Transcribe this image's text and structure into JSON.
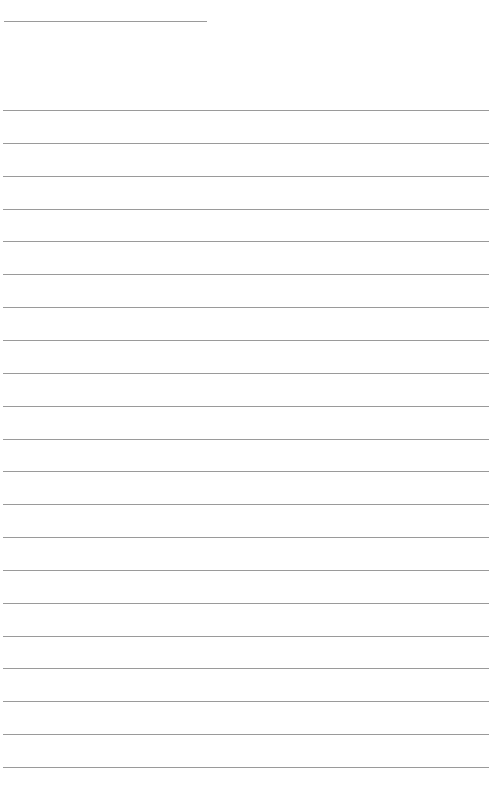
{
  "page": {
    "type": "lined-paper",
    "background": "#ffffff",
    "rule_color": "#9a9a9a",
    "header_line": {
      "top": 21,
      "left": 4,
      "width": 203
    },
    "ruled_lines": {
      "count": 21,
      "first_top": 110,
      "spacing": 32.85,
      "left": 3,
      "width": 486
    }
  }
}
